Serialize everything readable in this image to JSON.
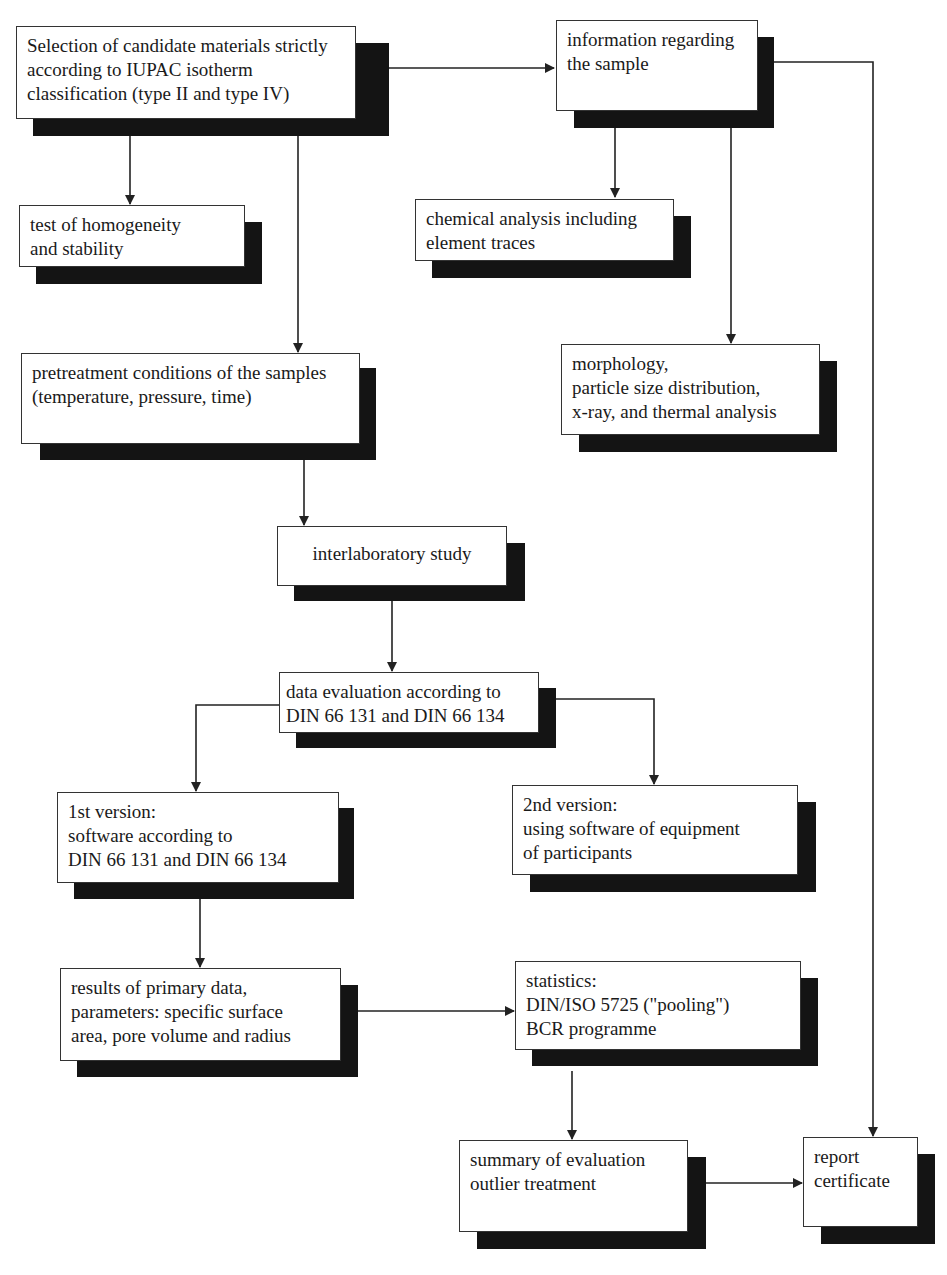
{
  "diagram": {
    "type": "flowchart",
    "nodes": [
      {
        "id": "selection",
        "label": "Selection of candidate materials strictly\naccording to IUPAC isotherm\nclassification (type II and type IV)"
      },
      {
        "id": "info",
        "label": "information regarding\nthe sample"
      },
      {
        "id": "homogeneity",
        "label": "test of homogeneity\nand stability"
      },
      {
        "id": "chemical",
        "label": "chemical analysis including\nelement traces"
      },
      {
        "id": "morphology",
        "label": "morphology,\nparticle size distribution,\nx-ray, and thermal analysis"
      },
      {
        "id": "pretreatment",
        "label": "pretreatment conditions of the samples\n(temperature, pressure, time)"
      },
      {
        "id": "interlab",
        "label": "interlaboratory study"
      },
      {
        "id": "evaluation",
        "label": "data evaluation according to\nDIN 66 131 and DIN 66 134"
      },
      {
        "id": "version1",
        "label": "1st version:\nsoftware according to\nDIN 66 131 and DIN 66 134"
      },
      {
        "id": "version2",
        "label": "2nd version:\nusing software of equipment\nof participants"
      },
      {
        "id": "results",
        "label": "results of primary data,\nparameters: specific surface\narea, pore volume and radius"
      },
      {
        "id": "statistics",
        "label": "statistics:\nDIN/ISO 5725 (\"pooling\")\nBCR programme"
      },
      {
        "id": "summary",
        "label": "summary of evaluation\noutlier treatment"
      },
      {
        "id": "report",
        "label": "report\ncertificate"
      }
    ],
    "edges": [
      {
        "from": "selection",
        "to": "info"
      },
      {
        "from": "selection",
        "to": "homogeneity"
      },
      {
        "from": "selection",
        "to": "pretreatment"
      },
      {
        "from": "info",
        "to": "chemical"
      },
      {
        "from": "info",
        "to": "morphology"
      },
      {
        "from": "info",
        "to": "report"
      },
      {
        "from": "pretreatment",
        "to": "interlab"
      },
      {
        "from": "interlab",
        "to": "evaluation"
      },
      {
        "from": "evaluation",
        "to": "version1"
      },
      {
        "from": "evaluation",
        "to": "version2"
      },
      {
        "from": "version1",
        "to": "results"
      },
      {
        "from": "results",
        "to": "statistics"
      },
      {
        "from": "statistics",
        "to": "summary"
      },
      {
        "from": "summary",
        "to": "report"
      }
    ]
  }
}
